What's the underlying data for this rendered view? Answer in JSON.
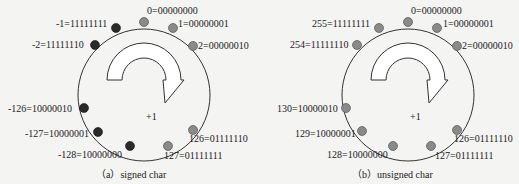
{
  "diagrams": [
    {
      "id": "a",
      "caption": "（a）signed char",
      "center_label": "+1",
      "points": [
        {
          "label": "0=00000000",
          "color": "#8a8a8a"
        },
        {
          "label": "1=00000001",
          "color": "#8a8a8a"
        },
        {
          "label": "2=00000010",
          "color": "#8a8a8a"
        },
        {
          "label": "126=01111110",
          "color": "#8a8a8a"
        },
        {
          "label": "127=01111111",
          "color": "#8a8a8a"
        },
        {
          "label": "-128=10000000",
          "color": "#2a2a2a"
        },
        {
          "label": "-127=10000001",
          "color": "#2a2a2a"
        },
        {
          "label": "-126=10000010",
          "color": "#2a2a2a"
        },
        {
          "label": "-2=11111110",
          "color": "#2a2a2a"
        },
        {
          "label": "-1=11111111",
          "color": "#2a2a2a"
        }
      ]
    },
    {
      "id": "b",
      "caption": "（b）unsigned char",
      "center_label": "+1",
      "points": [
        {
          "label": "0=00000000",
          "color": "#8a8a8a"
        },
        {
          "label": "1=00000001",
          "color": "#8a8a8a"
        },
        {
          "label": "2=00000010",
          "color": "#8a8a8a"
        },
        {
          "label": "126=01111110",
          "color": "#8a8a8a"
        },
        {
          "label": "127=01111111",
          "color": "#8a8a8a"
        },
        {
          "label": "128=10000000",
          "color": "#8a8a8a"
        },
        {
          "label": "129=10000001",
          "color": "#8a8a8a"
        },
        {
          "label": "130=10000010",
          "color": "#8a8a8a"
        },
        {
          "label": "254=11111110",
          "color": "#8a8a8a"
        },
        {
          "label": "255=11111111",
          "color": "#8a8a8a"
        }
      ]
    }
  ]
}
